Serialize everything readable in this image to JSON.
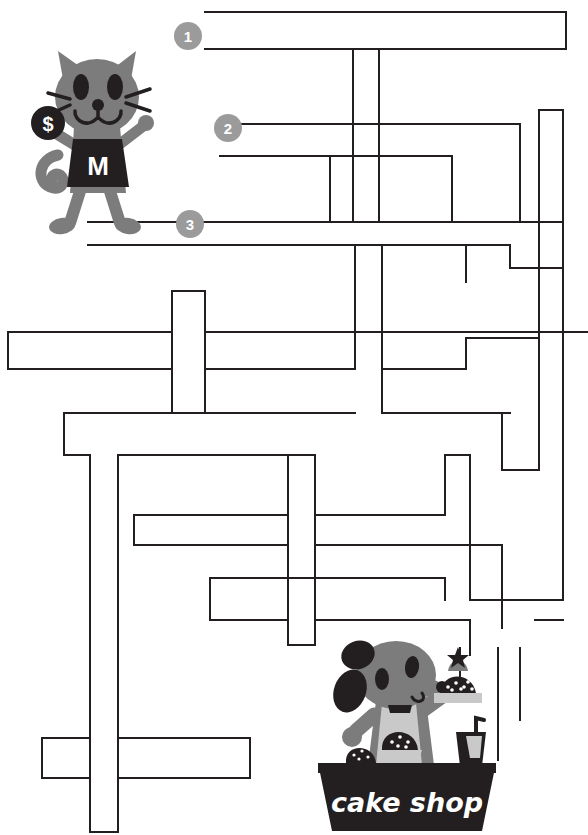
{
  "page": {
    "type": "maze-worksheet",
    "width": 588,
    "height": 835,
    "background_color": "#ffffff"
  },
  "colors": {
    "maze_line": "#231f20",
    "character_gray": "#7c7c7c",
    "character_light_gray": "#a6a6a6",
    "character_dark": "#231f20",
    "badge_gray": "#9b9b9b",
    "badge_text": "#ffffff",
    "sign_text": "#ffffff"
  },
  "entrances": [
    {
      "id": "entrance-1",
      "label": "1",
      "cx": 188,
      "cy": 36
    },
    {
      "id": "entrance-2",
      "label": "2",
      "cx": 228,
      "cy": 128
    },
    {
      "id": "entrance-3",
      "label": "3",
      "cx": 190,
      "cy": 224
    }
  ],
  "characters": {
    "cat": {
      "name": "cat-character",
      "shirt_letter": "M",
      "coin_symbol": "$",
      "x": 30,
      "y": 35
    },
    "dog": {
      "name": "dog-character",
      "x": 330,
      "y": 645
    }
  },
  "shop": {
    "name": "cake-shop-stall",
    "sign_text": "cake shop",
    "x": 318,
    "y": 763,
    "width": 176,
    "height": 68
  },
  "maze": {
    "stroke_width": 2,
    "line_color": "#231f20",
    "paths": [
      "M205,12 L565,12 L565,48 L205,48",
      "M205,48",
      "M352,48 L352,219",
      "M378,48 L378,219",
      "M218,122 L488,122",
      "M488,122 L488,219",
      "M218,154 L378,154",
      "M330,154 L330,219",
      "M88,219 L530,219",
      "M530,100 L530,330",
      "M505,100 L505,240",
      "M88,240 L432,240",
      "M432,240 L432,440",
      "M405,240 L405,330",
      "M172,290 L202,290 L202,332",
      "M8,332 L352,332",
      "M8,332 L8,368",
      "M8,368 L196,368",
      "M196,368 L196,398",
      "M60,398 L352,398",
      "M60,398 L60,455",
      "M60,455 L88,455",
      "M88,455 L88,835",
      "M352,290 L352,455",
      "M378,330 L378,520",
      "M116,520 L282,520",
      "M116,520 L116,835",
      "M282,455 L282,640",
      "M310,455 L310,640",
      "M205,575 L440,575",
      "M205,575 L205,618",
      "M205,618 L440,618",
      "M440,455 L440,520",
      "M465,460 L465,640",
      "M488,520 L560,520",
      "M505,330 L505,400",
      "M440,640 L560,640",
      "M560,400 L560,640",
      "M36,735 L246,735",
      "M36,735 L36,775",
      "M36,775 L246,775",
      "M146,775 L146,815",
      "M146,815 L88,815",
      "M310,640 L310,758",
      "M370,640 L370,700"
    ]
  }
}
